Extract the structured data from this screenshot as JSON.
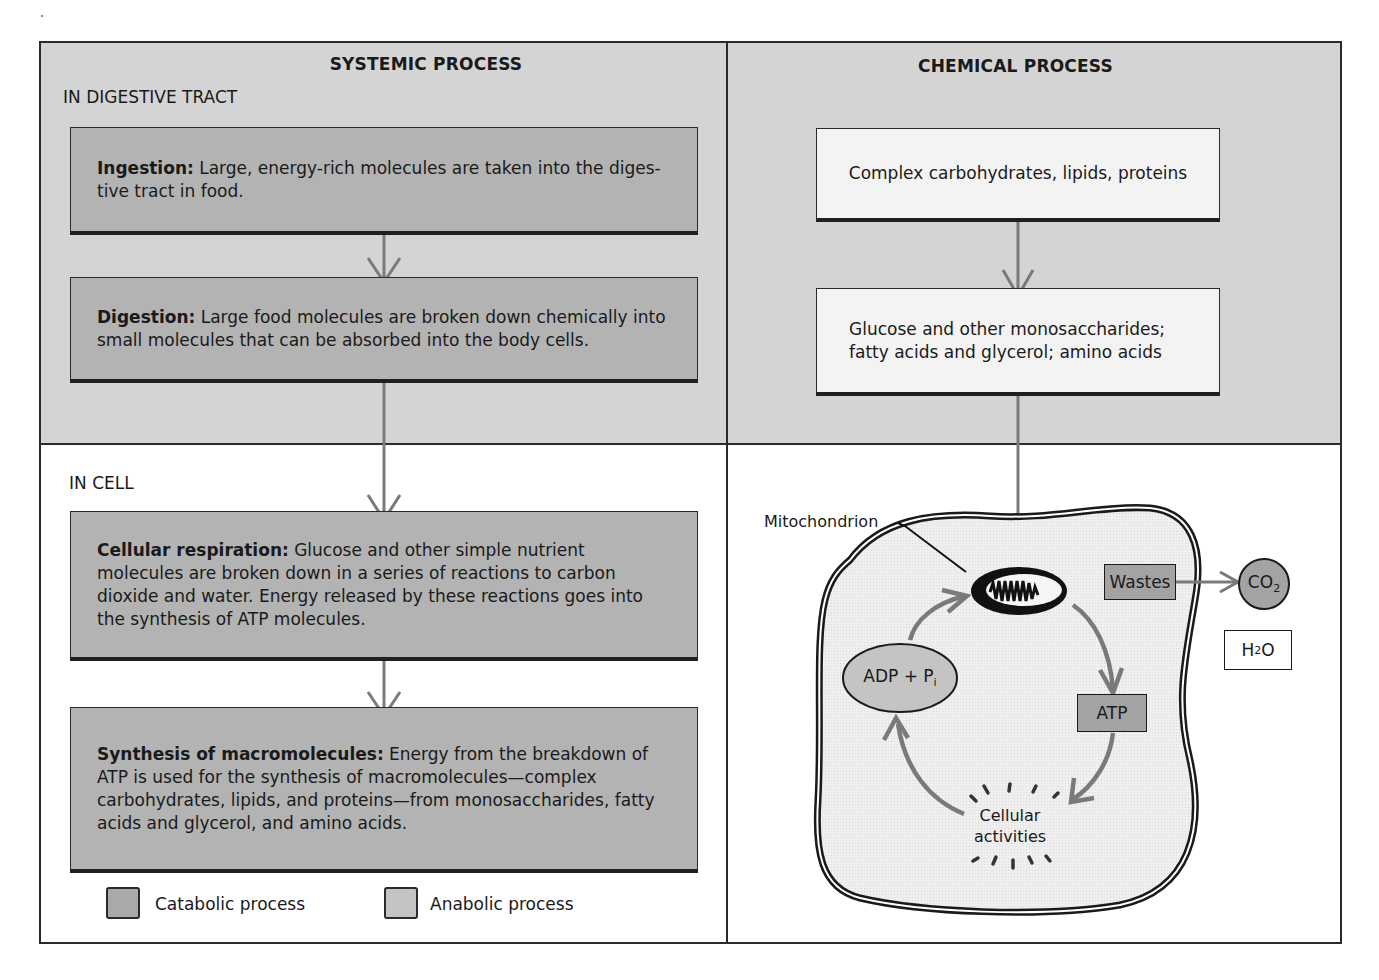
{
  "diagram": {
    "systemic": {
      "title": "SYSTEMIC PROCESS",
      "digestive_label": "IN DIGESTIVE TRACT",
      "cell_label": "IN CELL",
      "steps": [
        {
          "term": "Ingestion:",
          "text": " Large, energy-rich molecules are taken into the diges-tive tract in food.",
          "type": "catabolic"
        },
        {
          "term": "Digestion:",
          "text": " Large food molecules are broken down chemically into small molecules that can be absorbed into the body cells.",
          "type": "catabolic"
        },
        {
          "term": "Cellular respiration:",
          "text": " Glucose and other simple nutrient molecules are broken down in a series of reactions to carbon dioxide and water. Energy released by these reactions goes into the synthesis of ATP molecules.",
          "type": "catabolic"
        },
        {
          "term": "Synthesis of macromolecules:",
          "text": " Energy from the breakdown of ATP is used for the synthesis of macromolecules—complex carbohydrates, lipids, and proteins—from monosaccharides, fatty acids and glycerol, and amino acids.",
          "type": "anabolic"
        }
      ]
    },
    "chemical": {
      "title": "CHEMICAL PROCESS",
      "boxes": [
        {
          "text": "Complex carbohydrates, lipids, proteins"
        },
        {
          "line1": "Glucose and other monosaccharides;",
          "line2": "fatty acids and glycerol; amino acids"
        }
      ],
      "cell": {
        "mitochondrion_label": "Mitochondrion",
        "adp": {
          "main": "ADP + P",
          "sub": "i"
        },
        "atp": "ATP",
        "wastes": "Wastes",
        "co2": {
          "main": "CO",
          "sub": "2"
        },
        "h2o": {
          "pre": "H",
          "sub": "2",
          "post": "O"
        },
        "activities_line1": "Cellular",
        "activities_line2": "activities"
      }
    },
    "legend": [
      {
        "label": "Catabolic process",
        "color": "#a9a9a9"
      },
      {
        "label": "Anabolic process",
        "color": "#c4c4c4"
      }
    ],
    "colors": {
      "panel_shade": "#d4d4d4",
      "catabolic_box": "#b3b3b3",
      "arrow": "#7a7a7a",
      "border": "#2a2a2a"
    }
  }
}
